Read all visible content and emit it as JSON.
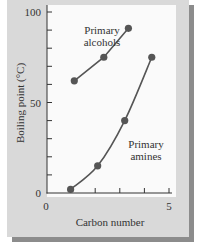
{
  "chart_data": {
    "type": "line",
    "title": "",
    "xlabel": "Carbon number",
    "ylabel": "Boiling point (°C)",
    "xlim": [
      0,
      5
    ],
    "ylim": [
      0,
      100
    ],
    "x_ticks": [
      0,
      1,
      2,
      3,
      4,
      5
    ],
    "x_tick_labels": [
      "0",
      "5"
    ],
    "y_ticks": [
      0,
      10,
      20,
      30,
      40,
      50,
      60,
      70,
      80,
      90,
      100
    ],
    "y_tick_labels": [
      "0",
      "50",
      "100"
    ],
    "grid": false,
    "legend": "inline annotations",
    "series": [
      {
        "name": "Primary alcohols",
        "label_lines": [
          "Primary",
          "alcohols"
        ],
        "x": [
          1.15,
          2.35,
          3.35
        ],
        "values": [
          62,
          75,
          91
        ]
      },
      {
        "name": "Primary amines",
        "label_lines": [
          "Primary",
          "amines"
        ],
        "x": [
          1.0,
          2.1,
          3.2,
          4.3
        ],
        "values": [
          2,
          15,
          40,
          75
        ]
      }
    ],
    "colors": {
      "series": "#555555",
      "axis": "#333333",
      "panel": "#d9d9d9",
      "shadow": "#8c8c8c",
      "plot_bg": "#fafafa"
    }
  }
}
